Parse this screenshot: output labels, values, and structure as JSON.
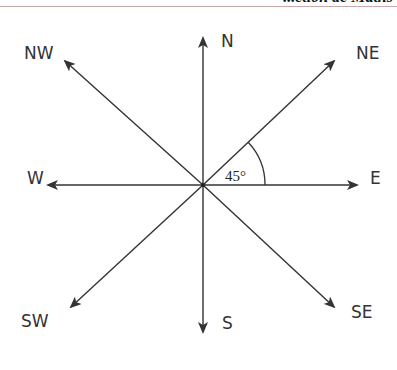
{
  "header": {
    "partial_title": "...ction de Maths",
    "rule_color": "#c9a9a9"
  },
  "compass": {
    "center": [
      203,
      185
    ],
    "line_color": "#333333",
    "directions": [
      {
        "label": "N",
        "angle_deg": 90
      },
      {
        "label": "NE",
        "angle_deg": 45
      },
      {
        "label": "E",
        "angle_deg": 0
      },
      {
        "label": "SE",
        "angle_deg": -45
      },
      {
        "label": "S",
        "angle_deg": -90
      },
      {
        "label": "SW",
        "angle_deg": -135
      },
      {
        "label": "W",
        "angle_deg": 180
      },
      {
        "label": "NW",
        "angle_deg": 135
      }
    ],
    "angle_marker": {
      "label": "45°",
      "between": [
        "E",
        "NE"
      ]
    }
  }
}
